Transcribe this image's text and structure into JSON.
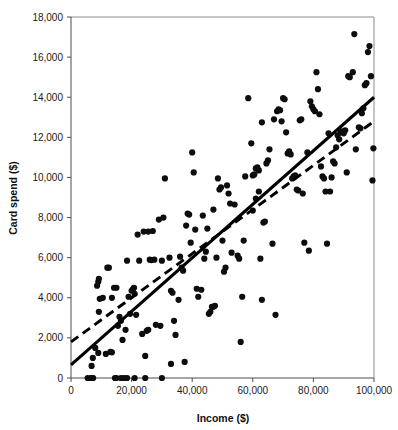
{
  "chart_data": {
    "type": "scatter",
    "title": "",
    "xlabel": "Income ($)",
    "ylabel": "Card spend ($)",
    "xlim": [
      0,
      100000
    ],
    "ylim": [
      0,
      18000
    ],
    "grid": false,
    "legend": "none",
    "xticks": [
      0,
      20000,
      40000,
      60000,
      80000,
      100000
    ],
    "xticklabels": [
      "0",
      "20,000",
      "40,000",
      "60,000",
      "80,000",
      "100,000"
    ],
    "yticks": [
      0,
      2000,
      4000,
      6000,
      8000,
      10000,
      12000,
      14000,
      16000,
      18000
    ],
    "yticklabels": [
      "0",
      "2,000",
      "4,000",
      "6,000",
      "8,000",
      "10,000",
      "12,000",
      "14,000",
      "16,000",
      "18,000"
    ],
    "point_color": "#0d0d0d",
    "point_size": 3.1,
    "series": [
      {
        "name": "observations",
        "marker": "filled-circle",
        "points": [
          [
            5500,
            0
          ],
          [
            6500,
            0
          ],
          [
            7000,
            0
          ],
          [
            7300,
            0
          ],
          [
            14500,
            0
          ],
          [
            15000,
            0
          ],
          [
            16500,
            0
          ],
          [
            17500,
            0
          ],
          [
            18500,
            0
          ],
          [
            21000,
            0
          ],
          [
            24500,
            0
          ],
          [
            30000,
            0
          ],
          [
            6800,
            600
          ],
          [
            7200,
            1000
          ],
          [
            8000,
            1500
          ],
          [
            9000,
            1250
          ],
          [
            11500,
            1200
          ],
          [
            13000,
            1300
          ],
          [
            13500,
            1280
          ],
          [
            9200,
            3300
          ],
          [
            9500,
            3950
          ],
          [
            8600,
            4600
          ],
          [
            9000,
            4800
          ],
          [
            9200,
            4950
          ],
          [
            12000,
            5500
          ],
          [
            13500,
            4000
          ],
          [
            14200,
            4500
          ],
          [
            15500,
            2600
          ],
          [
            16000,
            3050
          ],
          [
            16500,
            2850
          ],
          [
            17000,
            1900
          ],
          [
            18000,
            2400
          ],
          [
            19000,
            4050
          ],
          [
            20000,
            4350
          ],
          [
            20500,
            4450
          ],
          [
            21000,
            4200
          ],
          [
            20800,
            4500
          ],
          [
            18500,
            5850
          ],
          [
            19500,
            3200
          ],
          [
            21500,
            3150
          ],
          [
            22000,
            7150
          ],
          [
            24000,
            7300
          ],
          [
            25500,
            7300
          ],
          [
            27000,
            7330
          ],
          [
            23500,
            2200
          ],
          [
            24500,
            1100
          ],
          [
            25000,
            2350
          ],
          [
            25500,
            2400
          ],
          [
            26000,
            5900
          ],
          [
            26500,
            5880
          ],
          [
            27500,
            5900
          ],
          [
            28000,
            2650
          ],
          [
            29500,
            2600
          ],
          [
            30500,
            8000
          ],
          [
            29000,
            7900
          ],
          [
            31000,
            9950
          ],
          [
            32500,
            6000
          ],
          [
            33000,
            4350
          ],
          [
            33500,
            4250
          ],
          [
            34000,
            2850
          ],
          [
            34500,
            2150
          ],
          [
            33000,
            700
          ],
          [
            37500,
            800
          ],
          [
            35500,
            3900
          ],
          [
            36500,
            5500
          ],
          [
            37000,
            5350
          ],
          [
            38000,
            7600
          ],
          [
            38500,
            8200
          ],
          [
            39000,
            8150
          ],
          [
            39500,
            6750
          ],
          [
            40000,
            11250
          ],
          [
            40500,
            10250
          ],
          [
            41000,
            7400
          ],
          [
            41500,
            4450
          ],
          [
            42000,
            4050
          ],
          [
            43000,
            4400
          ],
          [
            44000,
            5950
          ],
          [
            44500,
            6300
          ],
          [
            45000,
            7450
          ],
          [
            45500,
            3200
          ],
          [
            46000,
            3300
          ],
          [
            46500,
            3550
          ],
          [
            47000,
            3550
          ],
          [
            47500,
            3600
          ],
          [
            47000,
            8400
          ],
          [
            48500,
            9950
          ],
          [
            49000,
            9400
          ],
          [
            49500,
            9500
          ],
          [
            50000,
            6850
          ],
          [
            50500,
            5300
          ],
          [
            51000,
            5500
          ],
          [
            51500,
            9600
          ],
          [
            52000,
            9200
          ],
          [
            52500,
            8700
          ],
          [
            54000,
            8650
          ],
          [
            55000,
            6100
          ],
          [
            55500,
            5950
          ],
          [
            56000,
            1800
          ],
          [
            56500,
            4050
          ],
          [
            57000,
            6850
          ],
          [
            58500,
            13950
          ],
          [
            59500,
            11700
          ],
          [
            60000,
            10100
          ],
          [
            60500,
            10150
          ],
          [
            61000,
            10450
          ],
          [
            61500,
            10500
          ],
          [
            62000,
            10350
          ],
          [
            60000,
            8350
          ],
          [
            61000,
            8950
          ],
          [
            62000,
            9300
          ],
          [
            62500,
            5950
          ],
          [
            63000,
            3900
          ],
          [
            63500,
            7750
          ],
          [
            64000,
            7800
          ],
          [
            64500,
            10700
          ],
          [
            65000,
            10850
          ],
          [
            65500,
            11400
          ],
          [
            66500,
            6700
          ],
          [
            67500,
            3150
          ],
          [
            68000,
            13300
          ],
          [
            68500,
            13400
          ],
          [
            69000,
            13350
          ],
          [
            69500,
            12800
          ],
          [
            70000,
            13950
          ],
          [
            70500,
            13900
          ],
          [
            71000,
            12250
          ],
          [
            71500,
            11200
          ],
          [
            72000,
            11300
          ],
          [
            72500,
            11150
          ],
          [
            73000,
            9950
          ],
          [
            73500,
            10050
          ],
          [
            74000,
            10100
          ],
          [
            74500,
            9400
          ],
          [
            75000,
            9350
          ],
          [
            75500,
            12850
          ],
          [
            76000,
            12900
          ],
          [
            76500,
            9200
          ],
          [
            77000,
            6750
          ],
          [
            78500,
            6350
          ],
          [
            79000,
            13800
          ],
          [
            79500,
            13550
          ],
          [
            80000,
            13400
          ],
          [
            80500,
            13300
          ],
          [
            81000,
            15250
          ],
          [
            81500,
            14400
          ],
          [
            82000,
            13150
          ],
          [
            82500,
            10550
          ],
          [
            83000,
            10050
          ],
          [
            83500,
            9950
          ],
          [
            84000,
            9300
          ],
          [
            84500,
            6700
          ],
          [
            85500,
            9300
          ],
          [
            86000,
            10000
          ],
          [
            86500,
            10800
          ],
          [
            87000,
            10700
          ],
          [
            88000,
            12100
          ],
          [
            88500,
            11900
          ],
          [
            89000,
            12250
          ],
          [
            89500,
            12300
          ],
          [
            90000,
            12200
          ],
          [
            90500,
            12350
          ],
          [
            91000,
            10250
          ],
          [
            91500,
            15050
          ],
          [
            92000,
            15000
          ],
          [
            93000,
            15250
          ],
          [
            93500,
            17150
          ],
          [
            94000,
            11400
          ],
          [
            95000,
            12500
          ],
          [
            95500,
            12450
          ],
          [
            96000,
            13200
          ],
          [
            96500,
            13450
          ],
          [
            97000,
            14600
          ],
          [
            97500,
            14700
          ],
          [
            98000,
            16250
          ],
          [
            98500,
            16550
          ],
          [
            99000,
            15050
          ],
          [
            99500,
            9850
          ],
          [
            99800,
            11450
          ],
          [
            85000,
            12200
          ],
          [
            87500,
            11500
          ],
          [
            78000,
            11250
          ],
          [
            67000,
            12900
          ],
          [
            63000,
            12750
          ],
          [
            57500,
            10050
          ],
          [
            53000,
            6250
          ],
          [
            48000,
            6000
          ],
          [
            43500,
            8100
          ],
          [
            36000,
            6050
          ],
          [
            30000,
            5850
          ],
          [
            22500,
            5850
          ],
          [
            12500,
            5500
          ],
          [
            10500,
            4000
          ],
          [
            15000,
            4500
          ]
        ]
      }
    ],
    "fit_lines": [
      {
        "name": "solid-regression-line",
        "style": "solid",
        "x_start": 0,
        "y_start": 650,
        "x_end": 100000,
        "y_end": 14000
      },
      {
        "name": "dashed-regression-line",
        "style": "dashed",
        "x_start": 0,
        "y_start": 1800,
        "x_end": 100000,
        "y_end": 12800
      }
    ]
  }
}
